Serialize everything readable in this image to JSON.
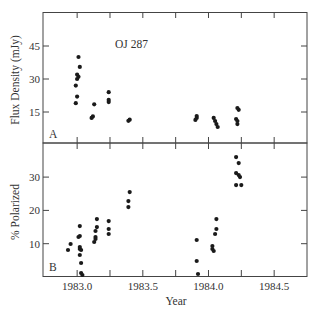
{
  "chart_data": [
    {
      "panel": "A",
      "type": "scatter",
      "title": "OJ 287",
      "annotation": "OJ 287",
      "panel_label": "A",
      "xlabel": "",
      "ylabel": "Flux Density (mJy)",
      "xlim": [
        1982.74,
        1984.75
      ],
      "ylim": [
        0,
        60
      ],
      "yticks": [
        15,
        30,
        45
      ],
      "ytick_labels": [
        "15",
        "30",
        "45"
      ],
      "xticks": [
        1983.0,
        1983.25,
        1983.5,
        1983.75,
        1984.0,
        1984.25,
        1984.5
      ],
      "grid": false,
      "points": [
        {
          "x": 1982.99,
          "y": 19
        },
        {
          "x": 1983.0,
          "y": 22
        },
        {
          "x": 1982.99,
          "y": 27
        },
        {
          "x": 1983.0,
          "y": 30
        },
        {
          "x": 1983.01,
          "y": 31
        },
        {
          "x": 1983.0,
          "y": 32
        },
        {
          "x": 1983.02,
          "y": 35.5
        },
        {
          "x": 1983.01,
          "y": 40
        },
        {
          "x": 1983.13,
          "y": 18.5
        },
        {
          "x": 1983.12,
          "y": 13
        },
        {
          "x": 1983.11,
          "y": 12.3
        },
        {
          "x": 1983.24,
          "y": 24
        },
        {
          "x": 1983.24,
          "y": 20.5
        },
        {
          "x": 1983.24,
          "y": 19.5
        },
        {
          "x": 1983.4,
          "y": 11.5
        },
        {
          "x": 1983.39,
          "y": 11
        },
        {
          "x": 1983.91,
          "y": 13.2
        },
        {
          "x": 1983.91,
          "y": 12.3
        },
        {
          "x": 1983.9,
          "y": 11.4
        },
        {
          "x": 1984.04,
          "y": 12.3
        },
        {
          "x": 1984.05,
          "y": 10.9
        },
        {
          "x": 1984.06,
          "y": 9.5
        },
        {
          "x": 1984.07,
          "y": 8.2
        },
        {
          "x": 1984.22,
          "y": 16.8
        },
        {
          "x": 1984.23,
          "y": 16
        },
        {
          "x": 1984.21,
          "y": 11.8
        },
        {
          "x": 1984.22,
          "y": 10.9
        },
        {
          "x": 1984.22,
          "y": 9.5
        }
      ]
    },
    {
      "panel": "B",
      "type": "scatter",
      "title": "",
      "panel_label": "B",
      "xlabel": "Year",
      "ylabel": "% Polarized",
      "xlim": [
        1982.74,
        1984.75
      ],
      "ylim": [
        0,
        40
      ],
      "yticks": [
        10,
        20,
        30
      ],
      "ytick_labels": [
        "10",
        "20",
        "30"
      ],
      "xticks": [
        1983.0,
        1983.25,
        1983.5,
        1983.75,
        1984.0,
        1984.25,
        1984.5
      ],
      "xtick_labels": [
        "1983.0",
        "1983.5",
        "1984.0",
        "1984.5"
      ],
      "xtick_label_values": [
        1983.0,
        1983.5,
        1984.0,
        1984.5
      ],
      "grid": false,
      "points": [
        {
          "x": 1982.93,
          "y": 8.1
        },
        {
          "x": 1982.95,
          "y": 9.9
        },
        {
          "x": 1983.02,
          "y": 15.3
        },
        {
          "x": 1983.02,
          "y": 12.3
        },
        {
          "x": 1983.01,
          "y": 12
        },
        {
          "x": 1983.02,
          "y": 9
        },
        {
          "x": 1983.02,
          "y": 8.4
        },
        {
          "x": 1983.03,
          "y": 8.1
        },
        {
          "x": 1983.02,
          "y": 6.6
        },
        {
          "x": 1983.03,
          "y": 4.2
        },
        {
          "x": 1983.03,
          "y": 1.2
        },
        {
          "x": 1983.04,
          "y": 0.6
        },
        {
          "x": 1983.15,
          "y": 17.4
        },
        {
          "x": 1983.15,
          "y": 15
        },
        {
          "x": 1983.14,
          "y": 13.8
        },
        {
          "x": 1983.14,
          "y": 12
        },
        {
          "x": 1983.14,
          "y": 11.4
        },
        {
          "x": 1983.13,
          "y": 10.5
        },
        {
          "x": 1983.24,
          "y": 16.8
        },
        {
          "x": 1983.24,
          "y": 14.4
        },
        {
          "x": 1983.24,
          "y": 12.9
        },
        {
          "x": 1983.4,
          "y": 25.5
        },
        {
          "x": 1983.39,
          "y": 22.8
        },
        {
          "x": 1983.39,
          "y": 21
        },
        {
          "x": 1983.91,
          "y": 11.1
        },
        {
          "x": 1983.91,
          "y": 4.8
        },
        {
          "x": 1983.92,
          "y": 0.9
        },
        {
          "x": 1984.06,
          "y": 17.4
        },
        {
          "x": 1984.06,
          "y": 14.4
        },
        {
          "x": 1984.05,
          "y": 12.9
        },
        {
          "x": 1984.03,
          "y": 9.3
        },
        {
          "x": 1984.03,
          "y": 8.4
        },
        {
          "x": 1984.04,
          "y": 7.8
        },
        {
          "x": 1984.21,
          "y": 36
        },
        {
          "x": 1984.23,
          "y": 34.2
        },
        {
          "x": 1984.21,
          "y": 31.2
        },
        {
          "x": 1984.23,
          "y": 30.6
        },
        {
          "x": 1984.24,
          "y": 30
        },
        {
          "x": 1984.21,
          "y": 27.6
        },
        {
          "x": 1984.25,
          "y": 27.6
        }
      ]
    }
  ],
  "layout": {
    "plot_left": 43,
    "plot_right": 307,
    "panel_a_top": 12,
    "panel_divider": 143,
    "panel_b_bottom": 276,
    "point_color": "#1a1a1a",
    "axis_color": "#444444",
    "text_color": "#333333"
  }
}
